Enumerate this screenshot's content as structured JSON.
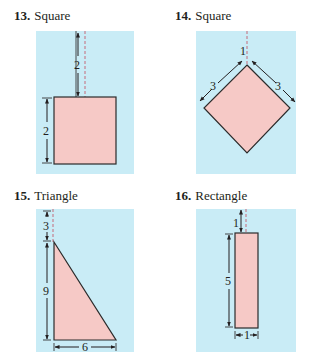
{
  "colors": {
    "panel_bg": "#c9ecf6",
    "shape_fill": "#f6c9c6",
    "shape_stroke": "#2b2b2b",
    "dash": "#c46b7a",
    "ink": "#231f20"
  },
  "problems": [
    {
      "number": "13.",
      "title": "Square",
      "shape": "square",
      "dims": {
        "gap_above": "2",
        "side": "2"
      }
    },
    {
      "number": "14.",
      "title": "Square",
      "shape": "diamond",
      "dims": {
        "gap_above": "1",
        "left_side": "3",
        "right_side": "3"
      }
    },
    {
      "number": "15.",
      "title": "Triangle",
      "shape": "right-triangle",
      "dims": {
        "gap_above": "3",
        "height": "9",
        "base": "6"
      }
    },
    {
      "number": "16.",
      "title": "Rectangle",
      "shape": "rectangle",
      "dims": {
        "gap_above": "1",
        "height": "5",
        "width": "1"
      }
    }
  ]
}
